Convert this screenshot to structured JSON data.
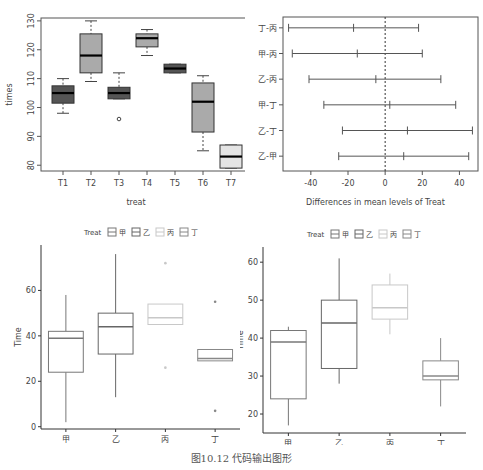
{
  "caption": "图10.12   代码输出图形",
  "chart_data": [
    {
      "type": "boxplot",
      "title": "",
      "xlabel": "treat",
      "ylabel": "times",
      "ylim": [
        78,
        131
      ],
      "yticks": [
        80,
        90,
        100,
        110,
        120,
        130
      ],
      "categories": [
        "T1",
        "T2",
        "T3",
        "T4",
        "T5",
        "T6",
        "T7"
      ],
      "boxes": [
        {
          "name": "T1",
          "min": 98,
          "q1": 101.5,
          "median": 105,
          "q3": 107.5,
          "max": 110,
          "outliers": [],
          "fill": "#555555"
        },
        {
          "name": "T2",
          "min": 109,
          "q1": 112,
          "median": 118,
          "q3": 125.5,
          "max": 130,
          "outliers": [],
          "fill": "#aaaaaa"
        },
        {
          "name": "T3",
          "min": 103,
          "q1": 103,
          "median": 105,
          "q3": 107,
          "max": 112,
          "outliers": [
            96
          ],
          "fill": "#555555"
        },
        {
          "name": "T4",
          "min": 118,
          "q1": 121,
          "median": 124,
          "q3": 125.5,
          "max": 127,
          "outliers": [],
          "fill": "#aaaaaa"
        },
        {
          "name": "T5",
          "min": 112,
          "q1": 112,
          "median": 113.5,
          "q3": 115,
          "max": 115,
          "outliers": [],
          "fill": "#555555"
        },
        {
          "name": "T6",
          "min": 85,
          "q1": 91.5,
          "median": 102,
          "q3": 108.5,
          "max": 111,
          "outliers": [],
          "fill": "#aaaaaa"
        },
        {
          "name": "T7",
          "min": 79,
          "q1": 79,
          "median": 83,
          "q3": 87,
          "max": 87,
          "outliers": [],
          "fill": "#e4e4e4"
        }
      ]
    },
    {
      "type": "errorbar",
      "title": "",
      "xlabel": "Differences in mean levels of Treat",
      "ylabel": "",
      "xlim": [
        -55,
        50
      ],
      "xticks": [
        -40,
        -20,
        0,
        20,
        40
      ],
      "reference_line": 0,
      "rows": [
        {
          "label": "丁-丙",
          "lwr": -52,
          "diff": -17,
          "upr": 18
        },
        {
          "label": "甲-丙",
          "lwr": -50,
          "diff": -15,
          "upr": 20
        },
        {
          "label": "乙-丙",
          "lwr": -41,
          "diff": -5,
          "upr": 30
        },
        {
          "label": "甲-丁",
          "lwr": -33,
          "diff": 2.5,
          "upr": 38
        },
        {
          "label": "乙-丁",
          "lwr": -23,
          "diff": 12,
          "upr": 47
        },
        {
          "label": "乙-甲",
          "lwr": -25,
          "diff": 10,
          "upr": 45
        }
      ]
    },
    {
      "type": "boxplot",
      "title": "",
      "legend": {
        "title": "Treat",
        "entries": [
          "甲",
          "乙",
          "丙",
          "丁"
        ],
        "position": "top"
      },
      "xlabel": "Treat",
      "ylabel": "Time",
      "ylim": [
        -1,
        80
      ],
      "yticks": [
        0,
        20,
        40,
        60
      ],
      "categories": [
        "甲",
        "乙",
        "丙",
        "丁"
      ],
      "boxes": [
        {
          "name": "甲",
          "min": 2,
          "q1": 24,
          "median": 39,
          "q3": 42,
          "max": 58,
          "outliers": [],
          "color": "#777777"
        },
        {
          "name": "乙",
          "min": 13,
          "q1": 32,
          "median": 44,
          "q3": 50,
          "max": 76,
          "outliers": [],
          "color": "#666666"
        },
        {
          "name": "丙",
          "min": 45,
          "q1": 45,
          "median": 48,
          "q3": 54,
          "max": 54,
          "outliers": [
            72,
            26
          ],
          "color": "#c8c8c8"
        },
        {
          "name": "丁",
          "min": 29,
          "q1": 29,
          "median": 30,
          "q3": 34,
          "max": 34,
          "outliers": [
            55,
            7
          ],
          "color": "#888888"
        }
      ]
    },
    {
      "type": "boxplot",
      "title": "",
      "legend": {
        "title": "Treat",
        "entries": [
          "甲",
          "乙",
          "丙",
          "丁"
        ],
        "position": "top"
      },
      "xlabel": "Treat",
      "ylabel": "Time",
      "ylim": [
        15,
        64
      ],
      "yticks": [
        20,
        30,
        40,
        50,
        60
      ],
      "categories": [
        "甲",
        "乙",
        "丙",
        "丁"
      ],
      "boxes": [
        {
          "name": "甲",
          "min": 17,
          "q1": 24,
          "median": 39,
          "q3": 42,
          "max": 43,
          "outliers": [],
          "color": "#777777"
        },
        {
          "name": "乙",
          "min": 28,
          "q1": 32,
          "median": 44,
          "q3": 50,
          "max": 61,
          "outliers": [],
          "color": "#666666"
        },
        {
          "name": "丙",
          "min": 41,
          "q1": 45,
          "median": 48,
          "q3": 54,
          "max": 57,
          "outliers": [],
          "color": "#c8c8c8"
        },
        {
          "name": "丁",
          "min": 22,
          "q1": 29,
          "median": 30,
          "q3": 34,
          "max": 40,
          "outliers": [],
          "color": "#888888"
        }
      ]
    }
  ]
}
